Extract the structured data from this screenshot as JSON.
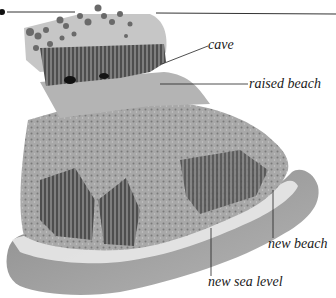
{
  "diagram": {
    "labels": {
      "cave": "cave",
      "raised_beach": "raised beach",
      "new_beach": "new beach",
      "new_sea_level": "new sea level"
    },
    "colors": {
      "background": "#ffffff",
      "rock_light": "#bdbdbd",
      "rock_mid": "#8c8c8c",
      "rock_dark": "#3a3a3a",
      "sea": "#9a9a9a",
      "surf": "#e6e6e6",
      "leader_line": "#222222"
    }
  }
}
